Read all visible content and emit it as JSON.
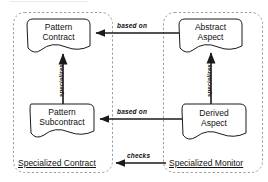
{
  "diagram": {
    "groups": [
      {
        "id": "specialized-contract",
        "label": "Specialized Contract",
        "style": "dashed-rounded-container"
      },
      {
        "id": "specialized-monitor",
        "label": "Specialized Monitor",
        "style": "dashed-rounded-container"
      }
    ],
    "nodes": [
      {
        "id": "pattern-contract",
        "line1": "Pattern",
        "line2": "Contract",
        "shape": "document-note",
        "group": "specialized-contract"
      },
      {
        "id": "pattern-subcontract",
        "line1": "Pattern",
        "line2": "Subcontract",
        "shape": "document-note",
        "group": "specialized-contract"
      },
      {
        "id": "abstract-aspect",
        "line1": "Abstract",
        "line2": "Aspect",
        "shape": "document-note",
        "group": "specialized-monitor"
      },
      {
        "id": "derived-aspect",
        "line1": "Derived",
        "line2": "Aspect",
        "shape": "document-note",
        "group": "specialized-monitor"
      }
    ],
    "edges": [
      {
        "id": "abstract-to-pattern-contract",
        "label": "based on",
        "from": "abstract-aspect",
        "to": "pattern-contract",
        "direction": "right-to-left",
        "orientation": "horizontal"
      },
      {
        "id": "derived-to-pattern-subcontract",
        "label": "based on",
        "from": "derived-aspect",
        "to": "pattern-subcontract",
        "direction": "right-to-left",
        "orientation": "horizontal"
      },
      {
        "id": "pattern-subcontract-specializes-pattern-contract",
        "label": "specializes",
        "from": "pattern-subcontract",
        "to": "pattern-contract",
        "direction": "bottom-to-top",
        "orientation": "vertical"
      },
      {
        "id": "derived-specializes-abstract",
        "label": "specializes",
        "from": "derived-aspect",
        "to": "abstract-aspect",
        "direction": "bottom-to-top",
        "orientation": "vertical"
      },
      {
        "id": "monitor-checks-contract",
        "label": "checks",
        "from": "specialized-monitor",
        "to": "specialized-contract",
        "direction": "right-to-left",
        "orientation": "horizontal"
      }
    ],
    "colors": {
      "stroke": "#1a1a1a",
      "group_stroke": "#8a8a8a",
      "background": "#ffffff",
      "text": "#111111"
    }
  }
}
